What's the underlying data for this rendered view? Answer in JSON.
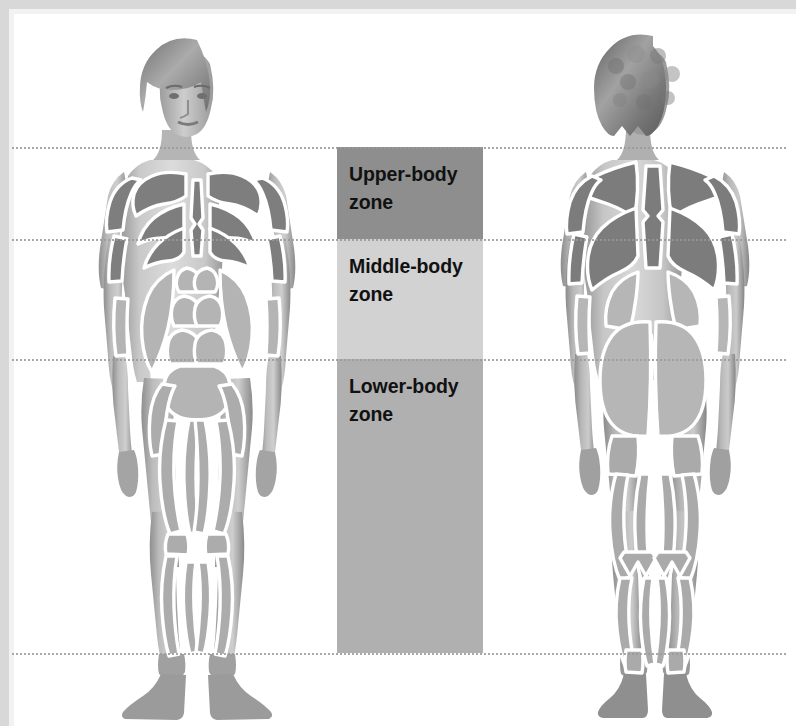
{
  "diagram": {
    "zone_bar": {
      "zones": [
        {
          "id": "upper",
          "label": "Upper-body zone",
          "line1": "Upper-body",
          "line2": "zone",
          "color": "#8e8e8e",
          "top_px": 147,
          "bottom_px": 239
        },
        {
          "id": "middle",
          "label": "Middle-body zone",
          "line1": "Middle-body",
          "line2": "zone",
          "color": "#d2d2d2",
          "top_px": 239,
          "bottom_px": 359
        },
        {
          "id": "lower",
          "label": "Lower-body zone",
          "line1": "Lower-body",
          "line2": "zone",
          "color": "#b0b0b0",
          "top_px": 359,
          "bottom_px": 653
        }
      ]
    },
    "boundary_lines": [
      {
        "id": "line-shoulders",
        "y_px": 147,
        "style": "dotted",
        "color": "#9a9a9a"
      },
      {
        "id": "line-chest",
        "y_px": 239,
        "style": "dotted",
        "color": "#9a9a9a"
      },
      {
        "id": "line-hips",
        "y_px": 359,
        "style": "dotted",
        "color": "#9a9a9a"
      },
      {
        "id": "line-ankles",
        "y_px": 653,
        "style": "dotted",
        "color": "#9a9a9a"
      }
    ],
    "figures": [
      {
        "id": "front",
        "view": "anterior",
        "description": "Female figure, front view, with muscle groups outlined in white over grey shading"
      },
      {
        "id": "back",
        "view": "posterior",
        "description": "Female figure, back view, with muscle groups outlined in white over grey shading"
      }
    ],
    "palette": {
      "background": "#ffffff",
      "frame": "#d8d8d8",
      "muscle_dark": "#808080",
      "muscle_mid": "#a6a6a6",
      "muscle_light": "#c4c4c4",
      "skin_dark": "#8a8a8a",
      "skin_mid": "#a3a3a3",
      "skin_light": "#bdbdbd",
      "outline": "#ffffff",
      "label_text": "#111111"
    }
  }
}
